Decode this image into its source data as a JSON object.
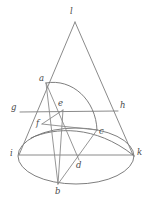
{
  "figure": {
    "background_color": "#ffffff",
    "line_color": "#7d7d7d",
    "label_color": "#4a4a4a",
    "width": 150,
    "height": 205,
    "labels": [
      {
        "id": "l",
        "text": "l",
        "x": 70,
        "y": 14
      },
      {
        "id": "a",
        "text": "a",
        "x": 39,
        "y": 81
      },
      {
        "id": "g",
        "text": "g",
        "x": 11,
        "y": 110
      },
      {
        "id": "e",
        "text": "e",
        "x": 58,
        "y": 106
      },
      {
        "id": "h",
        "text": "h",
        "x": 120,
        "y": 108
      },
      {
        "id": "f",
        "text": "f",
        "x": 36,
        "y": 126
      },
      {
        "id": "c",
        "text": "c",
        "x": 99,
        "y": 134
      },
      {
        "id": "i",
        "text": "i",
        "x": 10,
        "y": 156
      },
      {
        "id": "d",
        "text": "d",
        "x": 76,
        "y": 168
      },
      {
        "id": "k",
        "text": "k",
        "x": 137,
        "y": 155
      },
      {
        "id": "b",
        "text": "b",
        "x": 55,
        "y": 194
      }
    ],
    "points": {
      "l": [
        75,
        22
      ],
      "a": [
        46,
        83
      ],
      "g": [
        20,
        112
      ],
      "e": [
        63,
        110
      ],
      "h": [
        118,
        111
      ],
      "f": [
        42,
        124
      ],
      "c": [
        97,
        130
      ],
      "i": [
        19,
        155
      ],
      "d": [
        79,
        160
      ],
      "k": [
        133,
        155
      ],
      "b": [
        58,
        184
      ]
    },
    "edges": [
      {
        "name": "cone-left-side",
        "from": "l",
        "to": "i"
      },
      {
        "name": "cone-right-side",
        "from": "l",
        "to": "k"
      },
      {
        "name": "line-g-h",
        "from": "g",
        "to": "h"
      },
      {
        "name": "line-i-k",
        "from": "i",
        "to": "k"
      },
      {
        "name": "chord-a-d",
        "from": "a",
        "to": "d"
      },
      {
        "name": "chord-a-b",
        "from": "a",
        "to": "b"
      },
      {
        "name": "chord-b-c",
        "from": "b",
        "to": "c"
      },
      {
        "name": "chord-e-f",
        "from": "e",
        "to": "f"
      },
      {
        "name": "chord-e-b",
        "from": "e",
        "to": "b"
      },
      {
        "name": "chord-f-c",
        "from": "f",
        "to": "c"
      }
    ],
    "curves": [
      {
        "name": "base-ellipse",
        "type": "ellipse",
        "cx": 76,
        "cy": 156,
        "rx": 58,
        "ry": 28
      },
      {
        "name": "conic-section-a-c",
        "type": "arc"
      },
      {
        "name": "inner-arc-f-k",
        "type": "arc"
      }
    ]
  }
}
